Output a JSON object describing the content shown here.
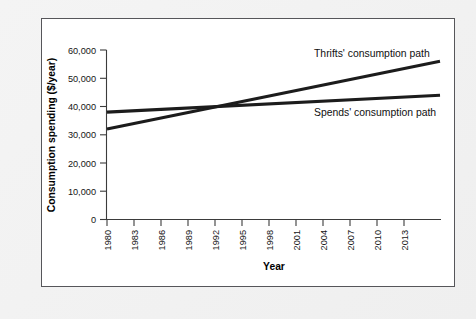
{
  "figure": {
    "panel_border_color": "#56565a",
    "panel_background": "#ffffff",
    "page_background": "#f2f2f2"
  },
  "chart_data": {
    "type": "line",
    "title": "",
    "xlabel": "Year",
    "ylabel": "Consumption spending ($/year)",
    "xlim": [
      1980,
      2017
    ],
    "ylim": [
      0,
      60000
    ],
    "grid": false,
    "legend_position": "inline-annotations",
    "x_tick_labels": [
      "1980",
      "1983",
      "1986",
      "1989",
      "1992",
      "1995",
      "1998",
      "2001",
      "2004",
      "2007",
      "2010",
      "2013"
    ],
    "x_ticks": [
      1980,
      1983,
      1986,
      1989,
      1992,
      1995,
      1998,
      2001,
      2004,
      2007,
      2010,
      2013
    ],
    "y_tick_labels": [
      "0",
      "10,000",
      "20,000",
      "30,000",
      "40,000",
      "50,000",
      "60,000"
    ],
    "y_ticks": [
      0,
      10000,
      20000,
      30000,
      40000,
      50000,
      60000
    ],
    "series": [
      {
        "name": "Thrifts' consumption path",
        "color": "#1c1c1c",
        "x": [
          1980,
          2017
        ],
        "values": [
          32000,
          56000
        ]
      },
      {
        "name": "Spends' consumption path",
        "color": "#1c1c1c",
        "x": [
          1980,
          2017
        ],
        "values": [
          38000,
          44000
        ]
      }
    ],
    "annotations": [
      {
        "text": "Thrifts' consumption path",
        "x": 2003,
        "y": 57500
      },
      {
        "text": "Spends' consumption path",
        "x": 2003,
        "y": 36500
      }
    ],
    "crossing_point": {
      "year": 1995,
      "value": 40000
    }
  },
  "labels": {
    "y_axis_title": "Consumption spending ($/year)",
    "x_axis_title": "Year",
    "thrifts_label": "Thrifts' consumption path",
    "spends_label": "Spends' consumption path",
    "y0": "0",
    "y1": "10,000",
    "y2": "20,000",
    "y3": "30,000",
    "y4": "40,000",
    "y5": "50,000",
    "y6": "60,000",
    "x0": "1980",
    "x1": "1983",
    "x2": "1986",
    "x3": "1989",
    "x4": "1992",
    "x5": "1995",
    "x6": "1998",
    "x7": "2001",
    "x8": "2004",
    "x9": "2007",
    "x10": "2010",
    "x11": "2013"
  }
}
